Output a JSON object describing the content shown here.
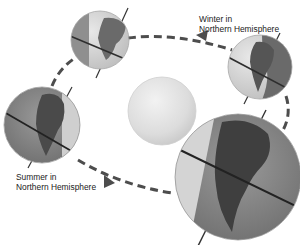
{
  "diagram": {
    "labels": {
      "winter": {
        "line1": "Winter in",
        "line2": "Northern Hemisphere"
      },
      "summer": {
        "line1": "Summer in",
        "line2": "Northern Hemisphere"
      }
    },
    "nodes": [
      {
        "id": "sun",
        "kind": "sun"
      },
      {
        "id": "earth-top",
        "kind": "earth",
        "position": "top"
      },
      {
        "id": "earth-right",
        "kind": "earth",
        "position": "right",
        "season": "Winter in Northern Hemisphere"
      },
      {
        "id": "earth-left",
        "kind": "earth",
        "position": "left",
        "season": "Summer in Northern Hemisphere"
      },
      {
        "id": "earth-front",
        "kind": "earth",
        "position": "front-bottom-right"
      }
    ],
    "orbit": {
      "style": "dashed",
      "direction": "counter-clockwise (viewed)",
      "arrows": 2
    },
    "colors": {
      "sun": "#d9d9d9",
      "ocean_lit": "#d6d6d6",
      "ocean_dark": "#8a8a8a",
      "land_dark": "#4a4a4a",
      "orbit": "#4d4d4d",
      "text": "#222222"
    }
  }
}
